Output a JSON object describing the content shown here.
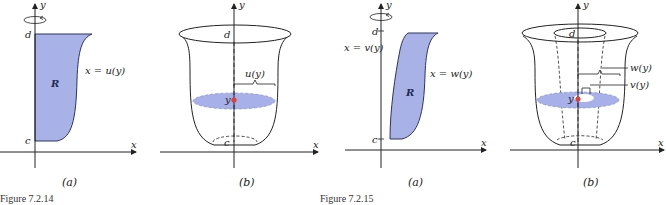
{
  "colors": {
    "region_fill": "#a9b2e6",
    "region_stroke": "#2b3560",
    "disk_fill": "#a7b0e8",
    "point": "#e0403a",
    "axis": "#222222"
  },
  "figure_7_2_14": {
    "caption": "Figure 7.2.14",
    "panel_a": {
      "sublabel": "(a)",
      "axis_y": "y",
      "axis_x": "x",
      "tick_top": "d",
      "tick_bottom": "c",
      "region_label": "R",
      "curve_label": "x = u(y)"
    },
    "panel_b": {
      "sublabel": "(b)",
      "axis_y": "y",
      "axis_x": "x",
      "tick_top": "d",
      "tick_bottom": "c",
      "point_label": "y",
      "radius_label": "u(y)"
    }
  },
  "figure_7_2_15": {
    "caption": "Figure 7.2.15",
    "panel_a": {
      "sublabel": "(a)",
      "axis_y": "y",
      "axis_x": "x",
      "tick_top": "d",
      "tick_bottom": "c",
      "region_label": "R",
      "left_curve_label": "x = v(y)",
      "right_curve_label": "x = w(y)"
    },
    "panel_b": {
      "sublabel": "(b)",
      "axis_y": "y",
      "axis_x": "x",
      "tick_top": "d",
      "tick_bottom": "c",
      "point_label": "y",
      "outer_radius_label": "w(y)",
      "inner_radius_label": "v(y)"
    }
  }
}
